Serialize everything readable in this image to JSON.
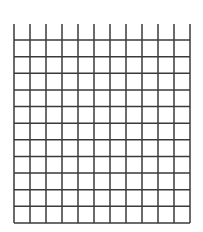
{
  "diagram": {
    "type": "grid",
    "columns": 11,
    "rows": 11,
    "line_color": "#3a3a3a",
    "background": "#ffffff",
    "left": 14,
    "right": 190,
    "top_stub": 24,
    "top": 40,
    "bottom": 223
  }
}
